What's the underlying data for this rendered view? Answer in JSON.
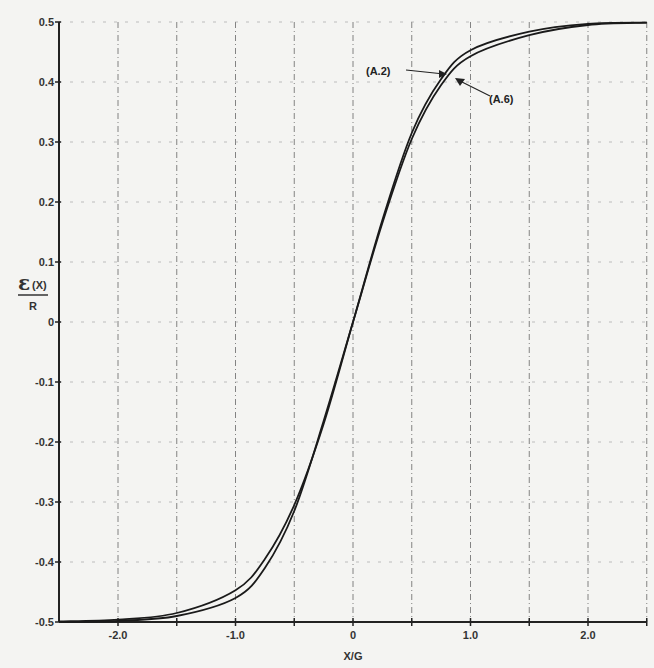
{
  "chart_data": {
    "type": "line",
    "title": "",
    "xlabel": "X/G",
    "ylabel_numerator": "ε (X)",
    "ylabel_denominator": "R",
    "xlim": [
      -2.5,
      2.5
    ],
    "ylim": [
      -0.5,
      0.5
    ],
    "grid": true,
    "x_ticks": [
      -2.0,
      -1.5,
      -1.0,
      -0.5,
      0,
      0.5,
      1.0,
      1.5,
      2.0,
      2.5
    ],
    "x_tick_labels": [
      "-2.0",
      "",
      "-1.0",
      "",
      "0",
      "",
      "1.0",
      "",
      "2.0",
      ""
    ],
    "y_ticks": [
      0.5,
      0.4,
      0.3,
      0.2,
      0.1,
      0,
      -0.1,
      -0.2,
      -0.3,
      -0.4,
      -0.5
    ],
    "y_tick_labels": [
      "0.5",
      "0.4",
      "0.3",
      "0.2",
      "0.1",
      "0",
      "-0.1",
      "-0.2",
      "-0.3",
      "-0.4",
      "-0.5"
    ],
    "x": [
      -2.5,
      -2.0,
      -1.5,
      -1.0,
      -0.75,
      -0.5,
      -0.25,
      0,
      0.25,
      0.5,
      0.75,
      1.0,
      1.5,
      2.0,
      2.5
    ],
    "series": [
      {
        "name": "(A.2)",
        "values": [
          -0.499,
          -0.496,
          -0.485,
          -0.447,
          -0.395,
          -0.305,
          -0.17,
          0,
          0.17,
          0.315,
          0.405,
          0.453,
          0.484,
          0.497,
          0.499
        ]
      },
      {
        "name": "(A.6)",
        "values": [
          -0.5,
          -0.498,
          -0.49,
          -0.46,
          -0.41,
          -0.315,
          -0.165,
          0,
          0.165,
          0.305,
          0.395,
          0.443,
          0.478,
          0.495,
          0.499
        ]
      }
    ],
    "annotations": [
      {
        "text": "(A.2)",
        "points_to_series": "(A.2)",
        "near_x": 0.75
      },
      {
        "text": "(A.6)",
        "points_to_series": "(A.6)",
        "near_x": 0.8
      }
    ]
  },
  "labels": {
    "x_axis": "X/G",
    "y_num": "ε",
    "y_num_sub": "(X)",
    "y_den": "R",
    "anno1": "(A.2)",
    "anno2": "(A.6)"
  }
}
